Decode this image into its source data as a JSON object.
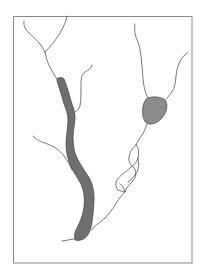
{
  "diagram": {
    "type": "vessel-schematic",
    "frame": {
      "x": 13,
      "y": 16,
      "width": 179,
      "height": 247,
      "stroke": "#8a8a8a"
    },
    "colors": {
      "background": "#ffffff",
      "line": "#555555",
      "thick_vessel_fill": "#6f6f6f",
      "thick_vessel_stroke": "#4a4a4a",
      "blob_fill": "#8c8c8c",
      "blob_stroke": "#4a4a4a"
    },
    "elements": [
      {
        "id": "top-left-branch-a",
        "kind": "thin-line"
      },
      {
        "id": "top-left-branch-b",
        "kind": "thin-line"
      },
      {
        "id": "trunk-to-thick-vessel",
        "kind": "thin-line"
      },
      {
        "id": "thick-vessel",
        "kind": "filled-tube"
      },
      {
        "id": "upper-right-side-branch",
        "kind": "thin-line"
      },
      {
        "id": "left-side-branch",
        "kind": "thin-line"
      },
      {
        "id": "bottom-tail",
        "kind": "thin-line"
      },
      {
        "id": "right-top-line",
        "kind": "thin-line"
      },
      {
        "id": "right-far-branch",
        "kind": "thin-line"
      },
      {
        "id": "rounded-blob",
        "kind": "filled-shape"
      },
      {
        "id": "braided-segment",
        "kind": "thin-line"
      },
      {
        "id": "lower-connector",
        "kind": "thin-line"
      }
    ]
  }
}
